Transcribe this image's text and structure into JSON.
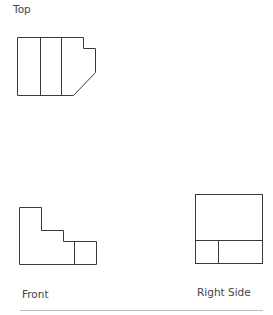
{
  "diagram": {
    "views": {
      "top": {
        "label": "Top"
      },
      "front": {
        "label": "Front"
      },
      "right": {
        "label": "Right Side"
      }
    },
    "colors": {
      "stroke": "#3a3a3a",
      "label": "#444444",
      "divider": "#bdbdbd",
      "background": "#ffffff"
    }
  }
}
